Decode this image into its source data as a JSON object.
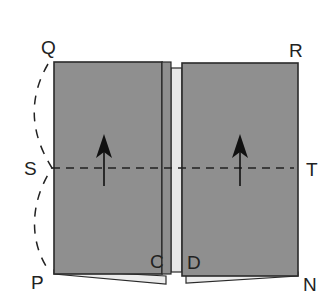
{
  "diagram": {
    "type": "folding-instruction",
    "colors": {
      "panel_fill": "#8f8f8f",
      "panel_stroke": "#2a2a2a",
      "strip_fill": "#e6e6e6",
      "underlayer_fill": "#ececec",
      "dash_color": "#222222",
      "arrow_color": "#111111",
      "label_color": "#222222",
      "background": "#ffffff"
    },
    "labels": {
      "Q": "Q",
      "R": "R",
      "S": "S",
      "T": "T",
      "P": "P",
      "N": "N",
      "C": "C",
      "D": "D"
    },
    "elements": {
      "left_panel": {
        "x": 54,
        "y": 62,
        "width": 108,
        "height": 212
      },
      "center_strip": {
        "x": 171,
        "y": 68,
        "width": 11,
        "height": 204
      },
      "right_panel": {
        "x": 182,
        "y": 63,
        "width": 116,
        "height": 213
      },
      "fold_line": {
        "x1": 50,
        "y1": 168,
        "x2": 296,
        "y2": 168,
        "style": "dashed"
      },
      "arrows": [
        {
          "x": 104,
          "y_tail": 186,
          "y_tip": 136,
          "direction": "up"
        },
        {
          "x": 240,
          "y_tail": 186,
          "y_tip": 136,
          "direction": "up"
        }
      ],
      "arc": {
        "from": "Q",
        "via": "S",
        "to": "P",
        "style": "dashed"
      }
    }
  }
}
